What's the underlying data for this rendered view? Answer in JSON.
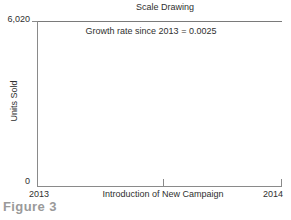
{
  "chart_data": {
    "type": "line",
    "title": "Scale Drawing",
    "xlabel": "",
    "ylabel": "Units Sold",
    "series": [],
    "x": [],
    "values": [],
    "xlim": [
      "2013",
      "2014"
    ],
    "ylim": [
      0,
      6020
    ],
    "x_tick_labels": [
      "2013",
      "2014"
    ],
    "y_tick_labels": [
      "0",
      "6,020"
    ],
    "x_midpoint_tick_label": "Introduction of New Campaign",
    "annotations": [
      "Growth rate since 2013 = 0.0025"
    ],
    "grid": false,
    "legend": false,
    "note": "Empty scale drawing: axes and annotation only, no plotted data series"
  },
  "figure": {
    "caption": "Figure 3"
  },
  "axis": {
    "y_max_label": "6,020",
    "y_min_label": "0",
    "y_title": "Units Sold",
    "x_start_label": "2013",
    "x_end_label": "2014",
    "x_event_label": "Introduction of New Campaign"
  },
  "colors": {
    "axis": "#8a8a8a",
    "text": "#2f2f2f",
    "caption": "#9a9a9a",
    "background": "#ffffff"
  }
}
